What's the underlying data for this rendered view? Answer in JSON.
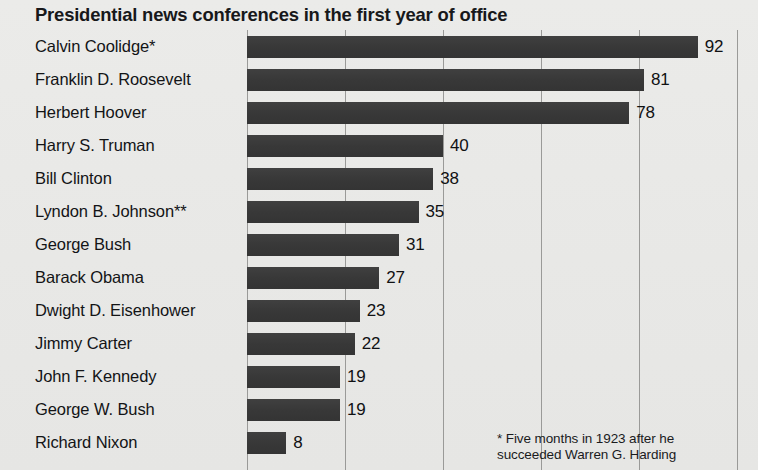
{
  "chart_data": {
    "type": "bar",
    "orientation": "horizontal",
    "title": "Presidential news conferences in the first year of office",
    "xlabel": "",
    "ylabel": "",
    "xlim": [
      0,
      100
    ],
    "grid": true,
    "gridlines": [
      0,
      20,
      40,
      60,
      80,
      100
    ],
    "legend": "none",
    "categories": [
      "Calvin Coolidge*",
      "Franklin D. Roosevelt",
      "Herbert Hoover",
      "Harry S. Truman",
      "Bill Clinton",
      "Lyndon B. Johnson**",
      "George Bush",
      "Barack Obama",
      "Dwight D. Eisenhower",
      "Jimmy Carter",
      "John F. Kennedy",
      "George W. Bush",
      "Richard Nixon"
    ],
    "values": [
      92,
      81,
      78,
      40,
      38,
      35,
      31,
      27,
      23,
      22,
      19,
      19,
      8
    ],
    "value_labels": [
      "92",
      "81",
      "78",
      "40",
      "38",
      "35",
      "31",
      "27",
      "23",
      "22",
      "19",
      "19",
      "8"
    ],
    "bar_color": "#3b3b3b",
    "background_color": "#e8e8e6",
    "gridline_color": "#9a9a98"
  },
  "footnote": {
    "line1": "* Five months in 1923 after he",
    "line2": "succeeded Warren G. Harding"
  }
}
